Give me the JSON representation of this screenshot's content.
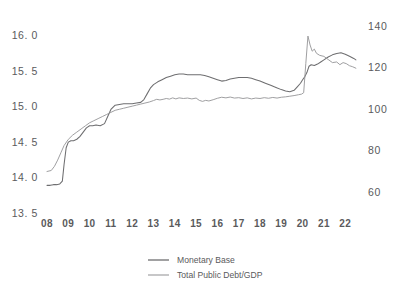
{
  "chart_data": {
    "type": "line",
    "title": "",
    "subtitle": "",
    "xlabel": "",
    "ylabel": "",
    "grid": false,
    "legend_position": "bottom-center",
    "x": [
      "08",
      "09",
      "10",
      "11",
      "12",
      "13",
      "14",
      "15",
      "16",
      "17",
      "18",
      "19",
      "20",
      "21",
      "22"
    ],
    "xtick_labels": [
      "08",
      "09",
      "10",
      "11",
      "12",
      "13",
      "14",
      "15",
      "16",
      "17",
      "18",
      "19",
      "20",
      "21",
      "22"
    ],
    "xlim": [
      2008,
      2022.6
    ],
    "axes": [
      {
        "id": "left",
        "name": "Monetary Base",
        "ylim": [
          13.5,
          16.25
        ],
        "ticks": [
          13.5,
          14.0,
          14.5,
          15.0,
          15.5,
          16.0
        ],
        "tick_labels": [
          "13. 5",
          "14. 0",
          "14. 5",
          "15. 0",
          "15. 5",
          "16. 0"
        ]
      },
      {
        "id": "right",
        "name": "Total Public Debt/GDP",
        "ylim": [
          50,
          144
        ],
        "ticks": [
          60,
          80,
          100,
          120,
          140
        ],
        "tick_labels": [
          "60",
          "80",
          "100",
          "120",
          "140"
        ]
      }
    ],
    "series": [
      {
        "name": "Monetary Base",
        "axis": "left",
        "color": "#6e6e70",
        "points": [
          [
            2008.0,
            13.89
          ],
          [
            2008.15,
            13.89
          ],
          [
            2008.3,
            13.9
          ],
          [
            2008.45,
            13.9
          ],
          [
            2008.6,
            13.91
          ],
          [
            2008.72,
            13.95
          ],
          [
            2008.8,
            14.18
          ],
          [
            2008.9,
            14.42
          ],
          [
            2009.0,
            14.5
          ],
          [
            2009.12,
            14.52
          ],
          [
            2009.25,
            14.52
          ],
          [
            2009.4,
            14.54
          ],
          [
            2009.55,
            14.58
          ],
          [
            2009.7,
            14.64
          ],
          [
            2009.85,
            14.7
          ],
          [
            2010.0,
            14.73
          ],
          [
            2010.15,
            14.73
          ],
          [
            2010.3,
            14.74
          ],
          [
            2010.5,
            14.73
          ],
          [
            2010.7,
            14.76
          ],
          [
            2010.85,
            14.86
          ],
          [
            2011.0,
            14.96
          ],
          [
            2011.2,
            15.02
          ],
          [
            2011.4,
            15.03
          ],
          [
            2011.6,
            15.04
          ],
          [
            2011.8,
            15.04
          ],
          [
            2012.0,
            15.04
          ],
          [
            2012.2,
            15.05
          ],
          [
            2012.4,
            15.06
          ],
          [
            2012.55,
            15.1
          ],
          [
            2012.7,
            15.18
          ],
          [
            2012.85,
            15.26
          ],
          [
            2013.0,
            15.31
          ],
          [
            2013.2,
            15.35
          ],
          [
            2013.4,
            15.38
          ],
          [
            2013.6,
            15.41
          ],
          [
            2013.8,
            15.43
          ],
          [
            2014.0,
            15.45
          ],
          [
            2014.2,
            15.46
          ],
          [
            2014.4,
            15.46
          ],
          [
            2014.6,
            15.45
          ],
          [
            2014.8,
            15.45
          ],
          [
            2015.0,
            15.45
          ],
          [
            2015.2,
            15.45
          ],
          [
            2015.4,
            15.44
          ],
          [
            2015.6,
            15.42
          ],
          [
            2015.8,
            15.4
          ],
          [
            2016.0,
            15.38
          ],
          [
            2016.2,
            15.36
          ],
          [
            2016.4,
            15.37
          ],
          [
            2016.6,
            15.39
          ],
          [
            2016.8,
            15.4
          ],
          [
            2017.0,
            15.41
          ],
          [
            2017.2,
            15.41
          ],
          [
            2017.4,
            15.41
          ],
          [
            2017.6,
            15.4
          ],
          [
            2017.8,
            15.38
          ],
          [
            2018.0,
            15.36
          ],
          [
            2018.25,
            15.33
          ],
          [
            2018.5,
            15.3
          ],
          [
            2018.75,
            15.27
          ],
          [
            2019.0,
            15.24
          ],
          [
            2019.2,
            15.22
          ],
          [
            2019.4,
            15.21
          ],
          [
            2019.6,
            15.23
          ],
          [
            2019.75,
            15.28
          ],
          [
            2019.9,
            15.33
          ],
          [
            2020.0,
            15.38
          ],
          [
            2020.1,
            15.42
          ],
          [
            2020.2,
            15.48
          ],
          [
            2020.3,
            15.57
          ],
          [
            2020.4,
            15.59
          ],
          [
            2020.55,
            15.58
          ],
          [
            2020.7,
            15.6
          ],
          [
            2020.85,
            15.63
          ],
          [
            2021.0,
            15.66
          ],
          [
            2021.2,
            15.7
          ],
          [
            2021.4,
            15.73
          ],
          [
            2021.6,
            15.75
          ],
          [
            2021.8,
            15.76
          ],
          [
            2022.0,
            15.74
          ],
          [
            2022.2,
            15.71
          ],
          [
            2022.4,
            15.68
          ],
          [
            2022.5,
            15.66
          ]
        ]
      },
      {
        "name": "Total Public Debt/GDP",
        "axis": "right",
        "color": "#9a9a9c",
        "points": [
          [
            2008.0,
            70.0
          ],
          [
            2008.2,
            70.5
          ],
          [
            2008.35,
            72.5
          ],
          [
            2008.5,
            75.5
          ],
          [
            2008.65,
            79.0
          ],
          [
            2008.8,
            82.5
          ],
          [
            2009.0,
            85.5
          ],
          [
            2009.2,
            87.5
          ],
          [
            2009.4,
            89.0
          ],
          [
            2009.6,
            90.5
          ],
          [
            2009.8,
            92.0
          ],
          [
            2010.0,
            93.5
          ],
          [
            2010.2,
            94.5
          ],
          [
            2010.4,
            95.5
          ],
          [
            2010.6,
            96.5
          ],
          [
            2010.8,
            97.5
          ],
          [
            2011.0,
            98.5
          ],
          [
            2011.2,
            99.5
          ],
          [
            2011.4,
            100.0
          ],
          [
            2011.6,
            100.5
          ],
          [
            2011.8,
            101.0
          ],
          [
            2012.0,
            101.5
          ],
          [
            2012.2,
            102.0
          ],
          [
            2012.4,
            102.5
          ],
          [
            2012.6,
            103.0
          ],
          [
            2012.8,
            103.5
          ],
          [
            2013.0,
            104.2
          ],
          [
            2013.15,
            104.8
          ],
          [
            2013.3,
            104.5
          ],
          [
            2013.45,
            104.8
          ],
          [
            2013.6,
            105.2
          ],
          [
            2013.75,
            104.9
          ],
          [
            2013.9,
            105.5
          ],
          [
            2014.05,
            105.0
          ],
          [
            2014.2,
            105.5
          ],
          [
            2014.4,
            105.2
          ],
          [
            2014.6,
            105.4
          ],
          [
            2014.8,
            105.0
          ],
          [
            2015.0,
            105.4
          ],
          [
            2015.15,
            104.3
          ],
          [
            2015.3,
            103.8
          ],
          [
            2015.45,
            104.3
          ],
          [
            2015.6,
            104.0
          ],
          [
            2015.8,
            104.6
          ],
          [
            2016.0,
            105.3
          ],
          [
            2016.2,
            105.8
          ],
          [
            2016.4,
            105.5
          ],
          [
            2016.6,
            105.9
          ],
          [
            2016.8,
            105.4
          ],
          [
            2017.0,
            105.6
          ],
          [
            2017.2,
            105.2
          ],
          [
            2017.4,
            105.5
          ],
          [
            2017.6,
            105.0
          ],
          [
            2017.8,
            105.4
          ],
          [
            2018.0,
            105.2
          ],
          [
            2018.2,
            105.6
          ],
          [
            2018.4,
            105.3
          ],
          [
            2018.6,
            105.7
          ],
          [
            2018.8,
            105.4
          ],
          [
            2019.0,
            105.8
          ],
          [
            2019.2,
            106.0
          ],
          [
            2019.4,
            106.3
          ],
          [
            2019.6,
            106.6
          ],
          [
            2019.8,
            107.0
          ],
          [
            2019.95,
            107.3
          ],
          [
            2020.05,
            108.0
          ],
          [
            2020.15,
            122.0
          ],
          [
            2020.25,
            135.3
          ],
          [
            2020.35,
            131.0
          ],
          [
            2020.45,
            128.0
          ],
          [
            2020.55,
            129.0
          ],
          [
            2020.65,
            127.0
          ],
          [
            2020.8,
            126.0
          ],
          [
            2021.0,
            125.5
          ],
          [
            2021.2,
            124.0
          ],
          [
            2021.4,
            122.5
          ],
          [
            2021.6,
            122.8
          ],
          [
            2021.75,
            121.5
          ],
          [
            2021.9,
            122.5
          ],
          [
            2022.05,
            122.0
          ],
          [
            2022.2,
            121.0
          ],
          [
            2022.35,
            120.5
          ],
          [
            2022.5,
            119.8
          ]
        ]
      }
    ],
    "legend": [
      {
        "label": "Monetary Base",
        "color": "#6e6e70"
      },
      {
        "label": "Total Public Debt/GDP",
        "color": "#9a9a9c"
      }
    ]
  }
}
